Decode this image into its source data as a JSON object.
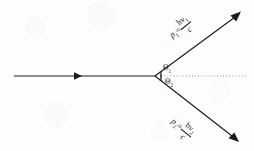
{
  "figure": {
    "type": "physics-vector-diagram",
    "background_color": "#fdfdfd",
    "line_color": "#1a1a1a",
    "reference_axis_color": "#9a9a9a"
  },
  "labels": {
    "incident_ray": "",
    "upper_momentum": {
      "symbol": "p",
      "subscript": "1",
      "equals": "=",
      "numerator": "hν",
      "numerator_subscript": "1",
      "denominator": "c"
    },
    "lower_momentum": {
      "symbol": "p",
      "subscript": "2",
      "equals": "=",
      "numerator": "hν",
      "numerator_subscript": "2",
      "denominator": "c"
    },
    "angle_upper": {
      "symbol": "Θ",
      "subscript": "1"
    },
    "angle_lower": {
      "symbol": "Θ",
      "subscript": "2"
    }
  },
  "geometry": {
    "vertex": {
      "x": 155,
      "y": 76
    },
    "incident_start": {
      "x": 14,
      "y": 76
    },
    "incident_arrow": {
      "x": 80,
      "y": 76
    },
    "upper_ray_tip": {
      "x": 240,
      "y": 12
    },
    "lower_ray_tip": {
      "x": 238,
      "y": 142
    },
    "reference_axis_end": {
      "x": 246,
      "y": 76
    },
    "upper_angle_degrees": 30,
    "lower_angle_degrees": 30
  }
}
